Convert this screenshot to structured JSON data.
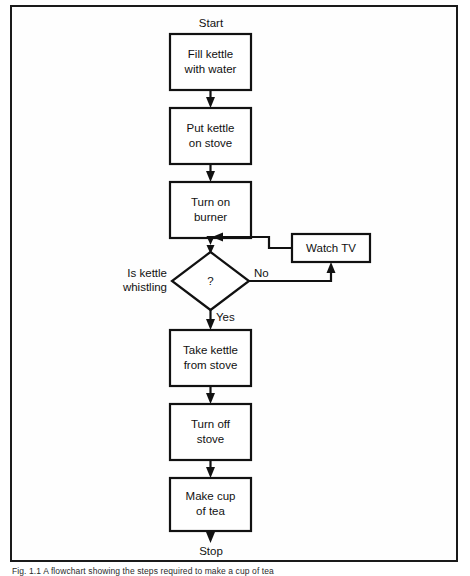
{
  "figure": {
    "caption": "Fig. 1.1 A flowchart showing the steps required to make a cup of tea",
    "border_color": "#1a1a1a",
    "line_color": "#111111",
    "background_color": "#ffffff"
  },
  "terminals": {
    "start": "Start",
    "stop": "Stop"
  },
  "nodes": [
    {
      "id": "fill-kettle",
      "type": "process",
      "lines": [
        "Fill kettle",
        "with water"
      ]
    },
    {
      "id": "put-kettle",
      "type": "process",
      "lines": [
        "Put kettle",
        "on stove"
      ]
    },
    {
      "id": "turn-on",
      "type": "process",
      "lines": [
        "Turn on",
        "burner"
      ]
    },
    {
      "id": "is-whistling",
      "type": "decision",
      "lines": [
        "?"
      ],
      "side_label": [
        "Is kettle",
        "whistling"
      ]
    },
    {
      "id": "watch-tv",
      "type": "process",
      "lines": [
        "Watch TV"
      ]
    },
    {
      "id": "take-kettle",
      "type": "process",
      "lines": [
        "Take kettle",
        "from stove"
      ]
    },
    {
      "id": "turn-off",
      "type": "process",
      "lines": [
        "Turn off",
        "stove"
      ]
    },
    {
      "id": "make-tea",
      "type": "process",
      "lines": [
        "Make cup",
        "of tea"
      ]
    }
  ],
  "edge_labels": {
    "no": "No",
    "yes": "Yes"
  }
}
